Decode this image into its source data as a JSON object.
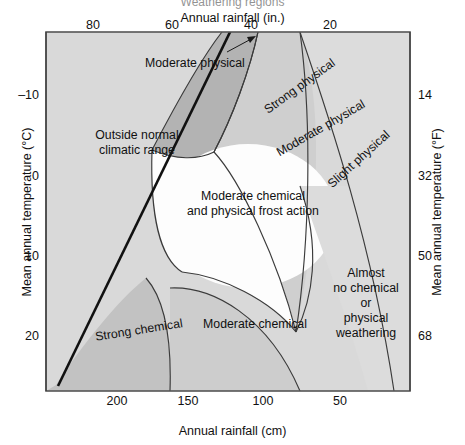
{
  "figure": {
    "clipped_caption": "Weathering regions",
    "top_axis_title": "Annual rainfall (in.)",
    "bottom_axis_title": "Annual rainfall (cm)",
    "left_axis_title": "Mean annual temperature (°C)",
    "right_axis_title": "Mean annual temperature (°F)"
  },
  "ticks": {
    "top": [
      "80",
      "60",
      "40",
      "20"
    ],
    "bottom": [
      "200",
      "150",
      "100",
      "50"
    ],
    "left": [
      "–10",
      "0",
      "10",
      "20"
    ],
    "right": [
      "14",
      "32",
      "50",
      "68"
    ]
  },
  "regions": [
    {
      "id": "outside-normal-climatic-range",
      "label": "Outside normal\nclimatic range"
    },
    {
      "id": "moderate-physical-callout",
      "label": "Moderate physical"
    },
    {
      "id": "strong-physical",
      "label": "Strong physical"
    },
    {
      "id": "moderate-physical",
      "label": "Moderate physical"
    },
    {
      "id": "slight-physical",
      "label": "Slight physical"
    },
    {
      "id": "moderate-chemical-and-physical-frost-action",
      "label": "Moderate chemical\nand physical frost action"
    },
    {
      "id": "strong-chemical",
      "label": "Strong chemical"
    },
    {
      "id": "moderate-chemical",
      "label": "Moderate chemical"
    },
    {
      "id": "almost-no-chemical-or-physical-weathering",
      "label": "Almost\nno chemical\nor\nphysical\nweathering"
    }
  ],
  "colors": {
    "plot_background": "#d9d9d9",
    "light_gray": "#dedede",
    "mid_gray": "#cfcfcf",
    "dark_gray": "#b4b4b4",
    "white_zone": "#fdfdfd",
    "frame": "#555555",
    "curve": "#3b3b3b",
    "divider": "#111111",
    "text": "#111111"
  },
  "chart_data": {
    "type": "diagram",
    "title": "Weathering regions",
    "xlabel": "Annual rainfall (cm)",
    "xlabel_secondary": "Annual rainfall (in.)",
    "ylabel": "Mean annual temperature (°C)",
    "ylabel_secondary": "Mean annual temperature (°F)",
    "x_axis": {
      "bottom": {
        "unit": "cm",
        "ticks": [
          200,
          150,
          100,
          50
        ],
        "direction": "decreasing-left-to-right",
        "range": [
          225,
          10
        ]
      },
      "top": {
        "unit": "in.",
        "ticks": [
          80,
          60,
          40,
          20
        ],
        "direction": "decreasing-left-to-right",
        "range": [
          90,
          4
        ]
      }
    },
    "y_axis": {
      "left": {
        "unit": "°C",
        "ticks": [
          -10,
          0,
          10,
          20
        ],
        "direction": "increasing-downward",
        "range": [
          -17,
          27
        ]
      },
      "right": {
        "unit": "°F",
        "ticks": [
          14,
          32,
          50,
          68
        ],
        "direction": "increasing-downward",
        "range": [
          1.4,
          80.6
        ]
      }
    },
    "grid": false,
    "legend": false,
    "zones": [
      {
        "name": "Outside normal climatic range",
        "shade": "light gray",
        "position": "upper-left, above main diagonal boundary"
      },
      {
        "name": "Strong physical",
        "shade": "dark gray",
        "position": "upper-middle lens, cold and moderately wet"
      },
      {
        "name": "Moderate physical",
        "shade": "mid gray",
        "position": "band below and right of strong physical"
      },
      {
        "name": "Slight physical",
        "shade": "light gray",
        "position": "band right of moderate physical"
      },
      {
        "name": "Moderate chemical and physical frost action",
        "shade": "white",
        "position": "center of diagram"
      },
      {
        "name": "Strong chemical",
        "shade": "mid gray",
        "position": "lower-left, warm and very wet"
      },
      {
        "name": "Moderate chemical",
        "shade": "light-mid gray",
        "position": "lower-center, warm and moderately wet"
      },
      {
        "name": "Almost no chemical or physical weathering",
        "shade": "light gray",
        "position": "lower-right, warm and dry"
      }
    ],
    "annotations": [
      {
        "text": "Moderate physical",
        "type": "leader-label-with-arrow",
        "points_to": "narrow moderate physical band near top of diagram"
      }
    ]
  }
}
